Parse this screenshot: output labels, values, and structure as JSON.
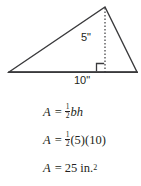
{
  "figure": {
    "type": "triangle-area-diagram",
    "shape": "triangle",
    "stroke_color": "#3a3a3c",
    "text_color": "#231f20",
    "background": "#ffffff",
    "labels": {
      "height": "5\"",
      "base": "10\""
    },
    "geometry": {
      "left_vertex": [
        9,
        72
      ],
      "apex": [
        105,
        7
      ],
      "right_vertex": [
        137,
        72
      ],
      "foot_of_altitude": [
        105,
        72
      ],
      "altitude_style": "dashed",
      "right_angle_marker": true
    },
    "measurements": {
      "height_value": 5,
      "height_unit": "in",
      "base_value": 10,
      "base_unit": "in",
      "area_value": 25,
      "area_unit": "in"
    }
  },
  "equations": {
    "line1": {
      "lhs": "A",
      "eq": "=",
      "numerator": "1",
      "denominator": "2",
      "rhs": "bh"
    },
    "line2": {
      "lhs": "A",
      "eq": "=",
      "numerator": "1",
      "denominator": "2",
      "rhs": "(5)(10)"
    },
    "line3": {
      "lhs": "A",
      "eq": "=",
      "rhs": "25 in.",
      "exponent": "2"
    }
  }
}
